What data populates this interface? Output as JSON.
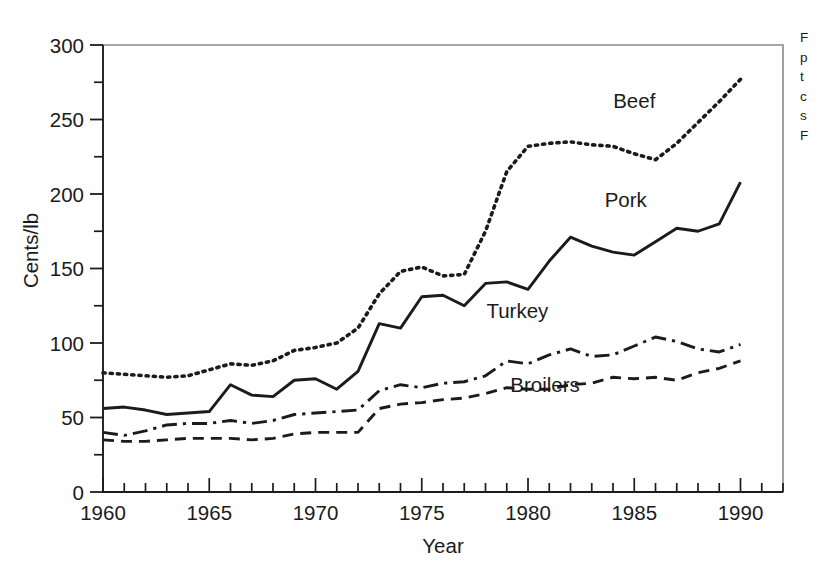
{
  "figure": {
    "background_color": "#ffffff",
    "ink_color": "#1b1b1b",
    "frame_color": "#8a8a8a"
  },
  "caption": {
    "lines": [
      "F",
      "p",
      "t",
      "c",
      "s",
      "F"
    ]
  },
  "chart_data": {
    "type": "line",
    "title": "",
    "xlabel": "Year",
    "ylabel": "Cents/lb",
    "xlim": [
      1960,
      1992
    ],
    "ylim": [
      0,
      300
    ],
    "grid": false,
    "legend_position": "inline-labels",
    "x_ticks_major": [
      1960,
      1965,
      1970,
      1975,
      1980,
      1985,
      1990
    ],
    "x_tick_labels": [
      "1960",
      "1965",
      "1970",
      "1975",
      "1980",
      "1985",
      "1990"
    ],
    "x_ticks_minor_step": 1,
    "y_ticks_major": [
      0,
      50,
      100,
      150,
      200,
      250,
      300
    ],
    "y_tick_labels": [
      "0",
      "50",
      "100",
      "150",
      "200",
      "250",
      "300"
    ],
    "y_ticks_minor": [
      25,
      75,
      125,
      175,
      225,
      275
    ],
    "x": [
      1960,
      1961,
      1962,
      1963,
      1964,
      1965,
      1966,
      1967,
      1968,
      1969,
      1970,
      1971,
      1972,
      1973,
      1974,
      1975,
      1976,
      1977,
      1978,
      1979,
      1980,
      1981,
      1982,
      1983,
      1984,
      1985,
      1986,
      1987,
      1988,
      1989,
      1990
    ],
    "series": [
      {
        "name": "Beef",
        "line_style": "dotted",
        "label_x": 1985,
        "label_y": 258,
        "values": [
          80,
          79,
          78,
          77,
          78,
          82,
          86,
          85,
          88,
          95,
          97,
          100,
          110,
          133,
          148,
          151,
          145,
          146,
          175,
          215,
          232,
          234,
          235,
          233,
          232,
          227,
          223,
          234,
          248,
          262,
          277
        ]
      },
      {
        "name": "Pork",
        "line_style": "solid",
        "label_x": 1984.6,
        "label_y": 191,
        "values": [
          56,
          57,
          55,
          52,
          53,
          54,
          72,
          65,
          64,
          75,
          76,
          69,
          81,
          113,
          110,
          131,
          132,
          125,
          140,
          141,
          136,
          155,
          171,
          165,
          161,
          159,
          168,
          177,
          175,
          180,
          208
        ]
      },
      {
        "name": "Turkey",
        "line_style": "dashdot",
        "label_x": 1979.5,
        "label_y": 117,
        "values": [
          40,
          38,
          41,
          45,
          46,
          46,
          48,
          46,
          48,
          52,
          53,
          54,
          55,
          68,
          72,
          70,
          73,
          74,
          78,
          88,
          86,
          92,
          96,
          91,
          92,
          98,
          104,
          101,
          96,
          94,
          99
        ]
      },
      {
        "name": "Broilers",
        "line_style": "dashed",
        "label_x": 1980.8,
        "label_y": 67,
        "values": [
          35,
          34,
          34,
          35,
          36,
          36,
          36,
          35,
          36,
          39,
          40,
          40,
          40,
          56,
          59,
          60,
          62,
          63,
          66,
          70,
          69,
          69,
          72,
          73,
          77,
          76,
          77,
          75,
          80,
          83,
          88
        ]
      }
    ]
  }
}
